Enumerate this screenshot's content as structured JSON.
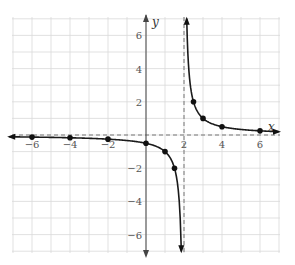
{
  "chart_data": {
    "type": "line",
    "title": "",
    "function": "y = 1/(x - 2)",
    "xlabel": "x",
    "ylabel": "y",
    "xlim": [
      -7,
      7
    ],
    "ylim": [
      -7,
      7
    ],
    "grid": true,
    "x_ticks": [
      -6,
      -4,
      -2,
      2,
      4,
      6
    ],
    "y_ticks": [
      -6,
      -4,
      -2,
      2,
      4,
      6
    ],
    "x_tick_labels": [
      "−6",
      "−4",
      "−2",
      "2",
      "4",
      "6"
    ],
    "y_tick_labels": [
      "−6",
      "−4",
      "−2",
      "2",
      "4",
      "6"
    ],
    "asymptotes": {
      "vertical": 2,
      "horizontal": 0,
      "style": "dashed"
    },
    "series": [
      {
        "name": "left branch",
        "points": [
          [
            -7,
            -0.111
          ],
          [
            -6,
            -0.125
          ],
          [
            -4,
            -0.167
          ],
          [
            -2,
            -0.25
          ],
          [
            0,
            -0.5
          ],
          [
            1,
            -1
          ],
          [
            1.5,
            -2
          ]
        ]
      },
      {
        "name": "right branch",
        "points": [
          [
            2.5,
            2
          ],
          [
            3,
            1
          ],
          [
            4,
            0.5
          ],
          [
            6,
            0.25
          ],
          [
            7,
            0.2
          ]
        ]
      }
    ]
  },
  "labels": {
    "x_axis": "x",
    "y_axis": "y"
  }
}
